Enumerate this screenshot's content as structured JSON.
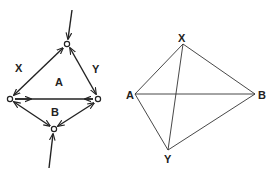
{
  "left_diagram": {
    "labels": {
      "x": "X",
      "y": "Y",
      "a": "A",
      "b": "B"
    },
    "nodes": [
      {
        "id": "top",
        "x": 67,
        "y": 44
      },
      {
        "id": "left",
        "x": 10,
        "y": 99
      },
      {
        "id": "right",
        "x": 98,
        "y": 99
      },
      {
        "id": "bottom",
        "x": 54,
        "y": 129
      }
    ],
    "edges": [
      {
        "from": "left",
        "to": "top",
        "bidirectional": true
      },
      {
        "from": "top",
        "to": "right",
        "bidirectional": true
      },
      {
        "from": "left",
        "to": "right",
        "bidirectional": true
      },
      {
        "from": "left",
        "to": "bottom",
        "bidirectional": true
      },
      {
        "from": "bottom",
        "to": "right",
        "bidirectional": true
      }
    ],
    "external_inputs": [
      {
        "to": "top",
        "from_x": 72,
        "from_y": 10
      },
      {
        "to": "bottom",
        "from_x": 49,
        "from_y": 168
      }
    ]
  },
  "right_diagram": {
    "labels": {
      "x": "X",
      "a": "A",
      "b": "B",
      "y": "Y"
    },
    "vertices": [
      {
        "id": "X",
        "x": 183,
        "y": 44
      },
      {
        "id": "A",
        "x": 135,
        "y": 94
      },
      {
        "id": "B",
        "x": 255,
        "y": 94
      },
      {
        "id": "Y",
        "x": 168,
        "y": 150
      }
    ],
    "edges": [
      [
        "X",
        "A"
      ],
      [
        "X",
        "B"
      ],
      [
        "A",
        "B"
      ],
      [
        "A",
        "Y"
      ],
      [
        "Y",
        "B"
      ],
      [
        "X",
        "Y"
      ]
    ]
  }
}
